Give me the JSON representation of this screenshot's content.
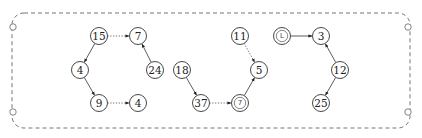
{
  "diagram": {
    "type": "directed-graph-forest",
    "border": {
      "style": "dashed-rounded-rectangle",
      "x": 12,
      "y": 13,
      "width": 398,
      "height": 115
    },
    "hooks": [
      {
        "id": "hook-top-left",
        "x": 13,
        "y": 27
      },
      {
        "id": "hook-bottom-left",
        "x": 13,
        "y": 112
      },
      {
        "id": "hook-top-right",
        "x": 408,
        "y": 27
      },
      {
        "id": "hook-bottom-right",
        "x": 408,
        "y": 112
      }
    ],
    "nodes": [
      {
        "id": "n15",
        "label": "15",
        "x": 99,
        "y": 36,
        "kind": "normal"
      },
      {
        "id": "n7a",
        "label": "7",
        "x": 138,
        "y": 36,
        "kind": "normal"
      },
      {
        "id": "n4a",
        "label": "4",
        "x": 80,
        "y": 70,
        "kind": "normal"
      },
      {
        "id": "n24",
        "label": "24",
        "x": 155,
        "y": 70,
        "kind": "normal"
      },
      {
        "id": "n9",
        "label": "9",
        "x": 99,
        "y": 103,
        "kind": "normal"
      },
      {
        "id": "n4b",
        "label": "4",
        "x": 138,
        "y": 103,
        "kind": "normal"
      },
      {
        "id": "n18",
        "label": "18",
        "x": 182,
        "y": 70,
        "kind": "normal"
      },
      {
        "id": "n37",
        "label": "37",
        "x": 201,
        "y": 103,
        "kind": "normal"
      },
      {
        "id": "n7c",
        "label": "7",
        "x": 240,
        "y": 103,
        "kind": "double-circle"
      },
      {
        "id": "n5",
        "label": "5",
        "x": 259,
        "y": 70,
        "kind": "normal"
      },
      {
        "id": "n11",
        "label": "11",
        "x": 240,
        "y": 36,
        "kind": "normal"
      },
      {
        "id": "nL",
        "label": "L",
        "x": 282,
        "y": 36,
        "kind": "double-circle"
      },
      {
        "id": "n3",
        "label": "3",
        "x": 321,
        "y": 36,
        "kind": "normal"
      },
      {
        "id": "n12",
        "label": "12",
        "x": 340,
        "y": 70,
        "kind": "normal"
      },
      {
        "id": "n25",
        "label": "25",
        "x": 321,
        "y": 103,
        "kind": "normal"
      }
    ],
    "edges": [
      {
        "from": "n15",
        "to": "n4a",
        "style": "solid"
      },
      {
        "from": "n4a",
        "to": "n9",
        "style": "solid"
      },
      {
        "from": "n15",
        "to": "n7a",
        "style": "dotted"
      },
      {
        "from": "n9",
        "to": "n4b",
        "style": "dotted"
      },
      {
        "from": "n24",
        "to": "n7a",
        "style": "solid"
      },
      {
        "from": "n18",
        "to": "n37",
        "style": "solid"
      },
      {
        "from": "n37",
        "to": "n7c",
        "style": "dotted"
      },
      {
        "from": "n7c",
        "to": "n5",
        "style": "solid"
      },
      {
        "from": "n11",
        "to": "n5",
        "style": "dotted"
      },
      {
        "from": "nL",
        "to": "n3",
        "style": "solid"
      },
      {
        "from": "n12",
        "to": "n3",
        "style": "solid"
      },
      {
        "from": "n12",
        "to": "n25",
        "style": "solid"
      }
    ],
    "node_radius": 8.5,
    "colors": {
      "stroke": "#333333",
      "border": "#666666",
      "background": "#ffffff"
    }
  }
}
